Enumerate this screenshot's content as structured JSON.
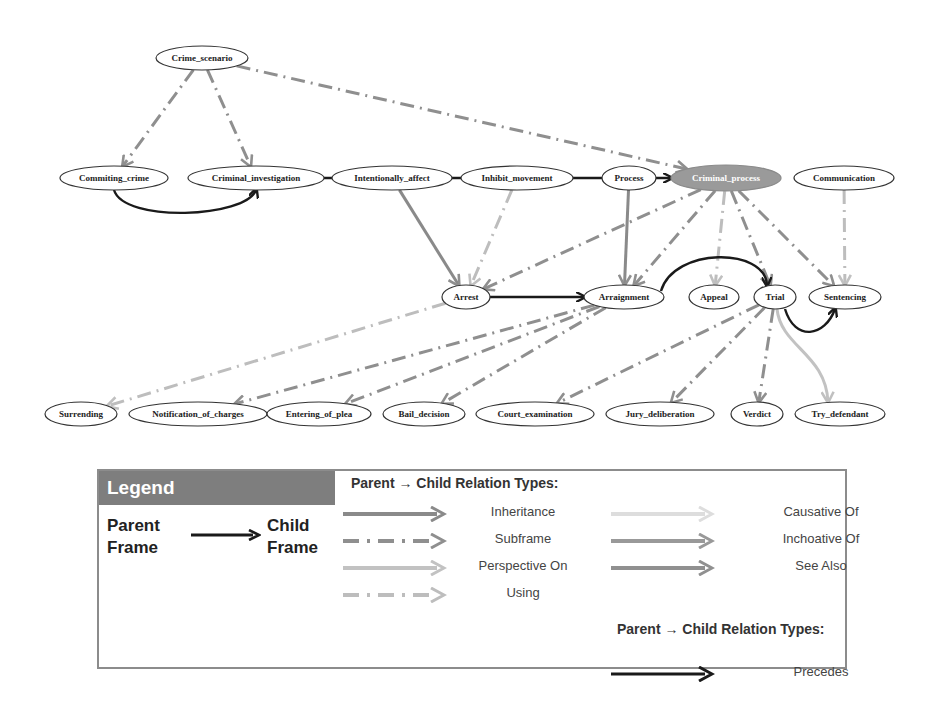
{
  "nodes": [
    {
      "id": "crime_scenario",
      "label": "Crime_scenario",
      "x": 202,
      "y": 58,
      "rx": 46,
      "ry": 12
    },
    {
      "id": "commiting_crime",
      "label": "Commiting_crime",
      "x": 114,
      "y": 178,
      "rx": 54,
      "ry": 12
    },
    {
      "id": "criminal_investigation",
      "label": "Criminal_investigation",
      "x": 256,
      "y": 178,
      "rx": 68,
      "ry": 12
    },
    {
      "id": "intentionally_affect",
      "label": "Intentionally_affect",
      "x": 392,
      "y": 178,
      "rx": 60,
      "ry": 12
    },
    {
      "id": "inhibit_movement",
      "label": "Inhibit_movement",
      "x": 517,
      "y": 178,
      "rx": 56,
      "ry": 12
    },
    {
      "id": "process",
      "label": "Process",
      "x": 629,
      "y": 178,
      "rx": 27,
      "ry": 12
    },
    {
      "id": "criminal_process",
      "label": "Criminal_process",
      "x": 726,
      "y": 178,
      "rx": 55,
      "ry": 13,
      "highlight": true
    },
    {
      "id": "communication",
      "label": "Communication",
      "x": 844,
      "y": 178,
      "rx": 50,
      "ry": 12
    },
    {
      "id": "arrest",
      "label": "Arrest",
      "x": 466,
      "y": 297,
      "rx": 24,
      "ry": 12
    },
    {
      "id": "arraignment",
      "label": "Arraignment",
      "x": 624,
      "y": 297,
      "rx": 40,
      "ry": 12
    },
    {
      "id": "appeal",
      "label": "Appeal",
      "x": 714,
      "y": 297,
      "rx": 25,
      "ry": 12
    },
    {
      "id": "trial",
      "label": "Trial",
      "x": 775,
      "y": 297,
      "rx": 21,
      "ry": 12
    },
    {
      "id": "sentencing",
      "label": "Sentencing",
      "x": 845,
      "y": 297,
      "rx": 36,
      "ry": 12
    },
    {
      "id": "surrending",
      "label": "Surrending",
      "x": 81,
      "y": 414,
      "rx": 36,
      "ry": 12
    },
    {
      "id": "notification_of_charges",
      "label": "Notification_of_charges",
      "x": 198,
      "y": 414,
      "rx": 69,
      "ry": 12
    },
    {
      "id": "entering_of_plea",
      "label": "Entering_of_plea",
      "x": 319,
      "y": 414,
      "rx": 52,
      "ry": 12
    },
    {
      "id": "bail_decision",
      "label": "Bail_decision",
      "x": 424,
      "y": 414,
      "rx": 41,
      "ry": 12
    },
    {
      "id": "court_examination",
      "label": "Court_examination",
      "x": 535,
      "y": 414,
      "rx": 59,
      "ry": 12
    },
    {
      "id": "jury_deliberation",
      "label": "Jury_deliberation",
      "x": 660,
      "y": 414,
      "rx": 54,
      "ry": 12
    },
    {
      "id": "verdict",
      "label": "Verdict",
      "x": 757,
      "y": 414,
      "rx": 26,
      "ry": 12
    },
    {
      "id": "try_defendant",
      "label": "Try_defendant",
      "x": 840,
      "y": 414,
      "rx": 45,
      "ry": 12
    }
  ],
  "edges": [
    {
      "from": "crime_scenario",
      "to": "commiting_crime",
      "type": "subframe"
    },
    {
      "from": "crime_scenario",
      "to": "criminal_investigation",
      "type": "subframe"
    },
    {
      "from": "crime_scenario",
      "to": "criminal_process",
      "type": "subframe"
    },
    {
      "from": "commiting_crime",
      "to": "criminal_investigation",
      "type": "precedes"
    },
    {
      "from": "criminal_investigation",
      "to": "criminal_process",
      "type": "precedes"
    },
    {
      "from": "intentionally_affect",
      "to": "arrest",
      "type": "inheritance"
    },
    {
      "from": "inhibit_movement",
      "to": "arrest",
      "type": "using"
    },
    {
      "from": "process",
      "to": "arraignment",
      "type": "inheritance"
    },
    {
      "from": "criminal_process",
      "to": "arrest",
      "type": "subframe"
    },
    {
      "from": "criminal_process",
      "to": "arraignment",
      "type": "subframe"
    },
    {
      "from": "criminal_process",
      "to": "appeal",
      "type": "using"
    },
    {
      "from": "criminal_process",
      "to": "trial",
      "type": "subframe"
    },
    {
      "from": "criminal_process",
      "to": "sentencing",
      "type": "subframe"
    },
    {
      "from": "communication",
      "to": "sentencing",
      "type": "using"
    },
    {
      "from": "arrest",
      "to": "arraignment",
      "type": "precedes"
    },
    {
      "from": "arraignment",
      "to": "trial",
      "type": "precedes"
    },
    {
      "from": "trial",
      "to": "sentencing",
      "type": "precedes"
    },
    {
      "from": "arrest",
      "to": "surrending",
      "type": "using"
    },
    {
      "from": "arraignment",
      "to": "notification_of_charges",
      "type": "subframe"
    },
    {
      "from": "arraignment",
      "to": "entering_of_plea",
      "type": "subframe"
    },
    {
      "from": "arraignment",
      "to": "bail_decision",
      "type": "subframe"
    },
    {
      "from": "trial",
      "to": "court_examination",
      "type": "subframe"
    },
    {
      "from": "trial",
      "to": "jury_deliberation",
      "type": "subframe"
    },
    {
      "from": "trial",
      "to": "verdict",
      "type": "subframe"
    },
    {
      "from": "trial",
      "to": "try_defendant",
      "type": "perspective_on"
    }
  ],
  "colors": {
    "inheritance": "#8a8a8a",
    "subframe": "#8f8f8f",
    "perspective_on": "#c2c2c2",
    "using": "#bdbdbd",
    "causative_of": "#dddddd",
    "inchoative_of": "#999999",
    "see_also": "#909090",
    "precedes": "#1a1a1a",
    "highlight_node": "#9a9a9a",
    "legend_header": "#7e7e7e"
  },
  "legend": {
    "header": "Legend",
    "parent_frame": [
      "Parent",
      "Frame"
    ],
    "child_frame": [
      "Child",
      "Frame"
    ],
    "title_1": "Parent → Child Relation Types:",
    "title_2": "Parent → Child Relation Types:",
    "items_left": [
      {
        "label": "Inheritance",
        "type": "inheritance"
      },
      {
        "label": "Subframe",
        "type": "subframe"
      },
      {
        "label": "Perspective On",
        "type": "perspective_on"
      },
      {
        "label": "Using",
        "type": "using"
      }
    ],
    "items_right": [
      {
        "label": "Causative Of",
        "type": "causative_of"
      },
      {
        "label": "Inchoative Of",
        "type": "inchoative_of"
      },
      {
        "label": "See Also",
        "type": "see_also"
      }
    ],
    "items_precedes": [
      {
        "label": "Precedes",
        "type": "precedes"
      }
    ]
  }
}
